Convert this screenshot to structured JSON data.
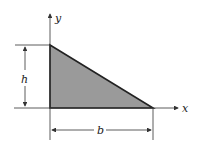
{
  "diagram": {
    "type": "right-triangle-section",
    "labels": {
      "y_axis": "y",
      "x_axis": "x",
      "height": "h",
      "base": "b"
    },
    "colors": {
      "fill": "#9a9a9a",
      "stroke": "#222222",
      "line": "#333333"
    }
  }
}
